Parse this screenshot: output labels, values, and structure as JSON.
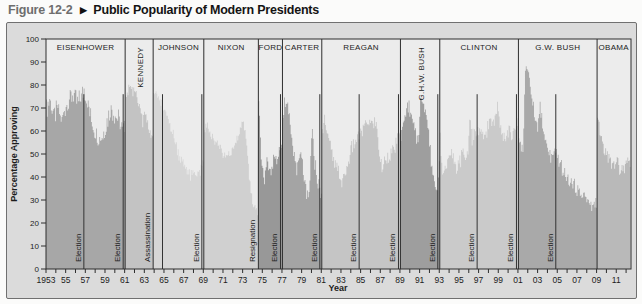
{
  "figure": {
    "number": "Figure 12-2",
    "caret": "▶",
    "title": "Public Popularity of Modern Presidents"
  },
  "chart_data": {
    "type": "area",
    "title": "Public Popularity of Modern Presidents",
    "xlabel": "Year",
    "ylabel": "Percentage Approving",
    "grid": false,
    "legend": "none",
    "plot_bg": "#ececec",
    "frame_color": "#2e2e2e",
    "marker_line_color": "#333333",
    "y_axis": {
      "min": 0,
      "max": 100,
      "tick_step": 10,
      "ticks": [
        0,
        10,
        20,
        30,
        40,
        50,
        60,
        70,
        80,
        90,
        100
      ]
    },
    "x_axis": {
      "min": 1953,
      "max": 2012.5,
      "minor_tick_step": 1,
      "ticks": [
        {
          "year": 1953,
          "label": "1953"
        },
        {
          "year": 1955,
          "label": "55"
        },
        {
          "year": 1957,
          "label": "57"
        },
        {
          "year": 1959,
          "label": "59"
        },
        {
          "year": 1961,
          "label": "61"
        },
        {
          "year": 1963,
          "label": "63"
        },
        {
          "year": 1965,
          "label": "65"
        },
        {
          "year": 1967,
          "label": "67"
        },
        {
          "year": 1969,
          "label": "69"
        },
        {
          "year": 1971,
          "label": "71"
        },
        {
          "year": 1973,
          "label": "73"
        },
        {
          "year": 1975,
          "label": "75"
        },
        {
          "year": 1977,
          "label": "77"
        },
        {
          "year": 1979,
          "label": "79"
        },
        {
          "year": 1981,
          "label": "81"
        },
        {
          "year": 1983,
          "label": "83"
        },
        {
          "year": 1985,
          "label": "85"
        },
        {
          "year": 1987,
          "label": "87"
        },
        {
          "year": 1989,
          "label": "89"
        },
        {
          "year": 1991,
          "label": "91"
        },
        {
          "year": 1993,
          "label": "93"
        },
        {
          "year": 1995,
          "label": "95"
        },
        {
          "year": 1997,
          "label": "97"
        },
        {
          "year": 1999,
          "label": "99"
        },
        {
          "year": 2001,
          "label": "01"
        },
        {
          "year": 2003,
          "label": "03"
        },
        {
          "year": 2005,
          "label": "05"
        },
        {
          "year": 2007,
          "label": "07"
        },
        {
          "year": 2009,
          "label": "09"
        },
        {
          "year": 2011,
          "label": "11"
        }
      ]
    },
    "series": [
      {
        "name": "EISENHOWER",
        "label_vertical": false,
        "color": "#a7a7a7",
        "noise": 5,
        "start": 1953.0,
        "end": 1961.05,
        "points": [
          [
            1953.0,
            69
          ],
          [
            1953.4,
            74
          ],
          [
            1953.8,
            66
          ],
          [
            1954.2,
            70
          ],
          [
            1954.6,
            64
          ],
          [
            1955.0,
            71
          ],
          [
            1955.4,
            74
          ],
          [
            1955.8,
            76
          ],
          [
            1956.2,
            72
          ],
          [
            1956.6,
            75
          ],
          [
            1956.9,
            78
          ],
          [
            1957.2,
            73
          ],
          [
            1957.6,
            65
          ],
          [
            1958.0,
            60
          ],
          [
            1958.4,
            57
          ],
          [
            1958.8,
            58
          ],
          [
            1959.2,
            64
          ],
          [
            1959.6,
            70
          ],
          [
            1960.0,
            67
          ],
          [
            1960.4,
            65
          ],
          [
            1960.8,
            60
          ],
          [
            1961.05,
            62
          ]
        ]
      },
      {
        "name": "KENNEDY",
        "label_vertical": true,
        "color": "#c3c3c3",
        "noise": 3,
        "start": 1961.05,
        "end": 1963.9,
        "points": [
          [
            1961.05,
            73
          ],
          [
            1961.3,
            77
          ],
          [
            1961.6,
            79
          ],
          [
            1961.9,
            78
          ],
          [
            1962.2,
            76
          ],
          [
            1962.5,
            70
          ],
          [
            1962.8,
            64
          ],
          [
            1963.1,
            68
          ],
          [
            1963.4,
            62
          ],
          [
            1963.7,
            58
          ],
          [
            1963.9,
            58
          ]
        ]
      },
      {
        "name": "JOHNSON",
        "label_vertical": false,
        "color": "#d6d6d6",
        "noise": 2.5,
        "start": 1963.9,
        "end": 1969.05,
        "points": [
          [
            1963.9,
            78
          ],
          [
            1964.2,
            76
          ],
          [
            1964.6,
            73
          ],
          [
            1964.9,
            70
          ],
          [
            1965.3,
            66
          ],
          [
            1965.7,
            62
          ],
          [
            1966.1,
            56
          ],
          [
            1966.5,
            50
          ],
          [
            1966.9,
            46
          ],
          [
            1967.3,
            44
          ],
          [
            1967.7,
            40
          ],
          [
            1968.1,
            42
          ],
          [
            1968.5,
            41
          ],
          [
            1968.9,
            44
          ],
          [
            1969.05,
            48
          ]
        ]
      },
      {
        "name": "NIXON",
        "label_vertical": false,
        "color": "#d0d0d0",
        "noise": 2,
        "start": 1969.05,
        "end": 1974.6,
        "points": [
          [
            1969.05,
            60
          ],
          [
            1969.4,
            62
          ],
          [
            1969.8,
            58
          ],
          [
            1970.2,
            56
          ],
          [
            1970.6,
            55
          ],
          [
            1971.0,
            50
          ],
          [
            1971.4,
            49
          ],
          [
            1971.8,
            50
          ],
          [
            1972.2,
            54
          ],
          [
            1972.6,
            59
          ],
          [
            1973.0,
            65
          ],
          [
            1973.3,
            59
          ],
          [
            1973.6,
            44
          ],
          [
            1973.9,
            31
          ],
          [
            1974.2,
            26
          ],
          [
            1974.6,
            24
          ]
        ]
      },
      {
        "name": "FORD",
        "label_vertical": false,
        "color": "#989898",
        "noise": 4,
        "start": 1974.6,
        "end": 1977.05,
        "points": [
          [
            1974.62,
            71
          ],
          [
            1974.75,
            66
          ],
          [
            1974.9,
            50
          ],
          [
            1975.1,
            39
          ],
          [
            1975.3,
            42
          ],
          [
            1975.5,
            47
          ],
          [
            1975.7,
            45
          ],
          [
            1975.9,
            43
          ],
          [
            1976.1,
            46
          ],
          [
            1976.3,
            48
          ],
          [
            1976.5,
            45
          ],
          [
            1976.7,
            50
          ],
          [
            1976.9,
            53
          ],
          [
            1977.05,
            53
          ]
        ]
      },
      {
        "name": "CARTER",
        "label_vertical": false,
        "color": "#a4a4a4",
        "noise": 4,
        "start": 1977.05,
        "end": 1981.05,
        "points": [
          [
            1977.05,
            66
          ],
          [
            1977.2,
            71
          ],
          [
            1977.4,
            74
          ],
          [
            1977.7,
            66
          ],
          [
            1978.0,
            55
          ],
          [
            1978.3,
            48
          ],
          [
            1978.6,
            43
          ],
          [
            1978.9,
            50
          ],
          [
            1979.2,
            42
          ],
          [
            1979.5,
            30
          ],
          [
            1979.8,
            32
          ],
          [
            1979.95,
            54
          ],
          [
            1980.1,
            58
          ],
          [
            1980.3,
            48
          ],
          [
            1980.6,
            39
          ],
          [
            1980.9,
            33
          ],
          [
            1981.05,
            34
          ]
        ]
      },
      {
        "name": "REAGAN",
        "label_vertical": false,
        "color": "#c5c5c5",
        "noise": 3,
        "start": 1981.05,
        "end": 1989.05,
        "points": [
          [
            1981.05,
            57
          ],
          [
            1981.3,
            67
          ],
          [
            1981.6,
            60
          ],
          [
            1981.9,
            54
          ],
          [
            1982.2,
            47
          ],
          [
            1982.5,
            44
          ],
          [
            1982.8,
            42
          ],
          [
            1983.1,
            37
          ],
          [
            1983.4,
            41
          ],
          [
            1983.7,
            45
          ],
          [
            1984.0,
            52
          ],
          [
            1984.3,
            54
          ],
          [
            1984.6,
            56
          ],
          [
            1984.9,
            59
          ],
          [
            1985.2,
            60
          ],
          [
            1985.5,
            63
          ],
          [
            1985.8,
            64
          ],
          [
            1986.1,
            63
          ],
          [
            1986.4,
            64
          ],
          [
            1986.7,
            61
          ],
          [
            1986.95,
            48
          ],
          [
            1987.2,
            43
          ],
          [
            1987.5,
            48
          ],
          [
            1987.8,
            49
          ],
          [
            1988.1,
            50
          ],
          [
            1988.4,
            52
          ],
          [
            1988.7,
            55
          ],
          [
            1989.05,
            62
          ]
        ]
      },
      {
        "name": "G.H.W. BUSH",
        "label_vertical": true,
        "color": "#9e9e9e",
        "noise": 3,
        "start": 1989.05,
        "end": 1993.05,
        "points": [
          [
            1989.05,
            56
          ],
          [
            1989.3,
            62
          ],
          [
            1989.6,
            68
          ],
          [
            1989.9,
            71
          ],
          [
            1990.1,
            67
          ],
          [
            1990.4,
            62
          ],
          [
            1990.7,
            56
          ],
          [
            1990.9,
            58
          ],
          [
            1991.1,
            73
          ],
          [
            1991.3,
            74
          ],
          [
            1991.6,
            70
          ],
          [
            1991.9,
            60
          ],
          [
            1992.2,
            46
          ],
          [
            1992.5,
            38
          ],
          [
            1992.8,
            35
          ],
          [
            1992.95,
            43
          ],
          [
            1993.05,
            50
          ]
        ]
      },
      {
        "name": "CLINTON",
        "label_vertical": false,
        "color": "#cacaca",
        "noise": 3.5,
        "start": 1993.05,
        "end": 2001.05,
        "points": [
          [
            1993.05,
            58
          ],
          [
            1993.3,
            45
          ],
          [
            1993.6,
            42
          ],
          [
            1993.9,
            49
          ],
          [
            1994.2,
            52
          ],
          [
            1994.5,
            45
          ],
          [
            1994.8,
            42
          ],
          [
            1995.1,
            47
          ],
          [
            1995.4,
            50
          ],
          [
            1995.7,
            48
          ],
          [
            1995.95,
            52
          ],
          [
            1996.1,
            68
          ],
          [
            1996.3,
            57
          ],
          [
            1996.6,
            58
          ],
          [
            1996.9,
            60
          ],
          [
            1997.2,
            58
          ],
          [
            1997.5,
            57
          ],
          [
            1997.8,
            60
          ],
          [
            1998.1,
            64
          ],
          [
            1998.4,
            63
          ],
          [
            1998.7,
            65
          ],
          [
            1998.95,
            72
          ],
          [
            1999.2,
            64
          ],
          [
            1999.5,
            59
          ],
          [
            1999.8,
            57
          ],
          [
            2000.1,
            61
          ],
          [
            2000.4,
            58
          ],
          [
            2000.7,
            59
          ],
          [
            2001.05,
            64
          ]
        ]
      },
      {
        "name": "G.W. BUSH",
        "label_vertical": false,
        "color": "#a9a9a9",
        "noise": 3,
        "start": 2001.05,
        "end": 2009.05,
        "points": [
          [
            2001.05,
            58
          ],
          [
            2001.3,
            54
          ],
          [
            2001.55,
            52
          ],
          [
            2001.72,
            86
          ],
          [
            2001.9,
            88
          ],
          [
            2002.1,
            83
          ],
          [
            2002.4,
            76
          ],
          [
            2002.7,
            68
          ],
          [
            2003.0,
            60
          ],
          [
            2003.25,
            72
          ],
          [
            2003.5,
            62
          ],
          [
            2003.8,
            55
          ],
          [
            2004.1,
            51
          ],
          [
            2004.4,
            48
          ],
          [
            2004.7,
            50
          ],
          [
            2005.0,
            49
          ],
          [
            2005.3,
            46
          ],
          [
            2005.6,
            42
          ],
          [
            2005.9,
            40
          ],
          [
            2006.2,
            38
          ],
          [
            2006.5,
            37
          ],
          [
            2006.8,
            36
          ],
          [
            2007.1,
            34
          ],
          [
            2007.4,
            32
          ],
          [
            2007.7,
            33
          ],
          [
            2008.0,
            30
          ],
          [
            2008.3,
            28
          ],
          [
            2008.6,
            27
          ],
          [
            2008.9,
            29
          ],
          [
            2009.05,
            30
          ]
        ]
      },
      {
        "name": "OBAMA",
        "label_vertical": false,
        "color": "#b9b9b9",
        "noise": 3.5,
        "start": 2009.05,
        "end": 2012.45,
        "points": [
          [
            2009.05,
            64
          ],
          [
            2009.3,
            61
          ],
          [
            2009.6,
            55
          ],
          [
            2009.9,
            50
          ],
          [
            2010.2,
            48
          ],
          [
            2010.5,
            46
          ],
          [
            2010.8,
            45
          ],
          [
            2011.1,
            47
          ],
          [
            2011.4,
            43
          ],
          [
            2011.7,
            42
          ],
          [
            2012.0,
            45
          ],
          [
            2012.3,
            47
          ],
          [
            2012.45,
            46
          ]
        ]
      }
    ],
    "markers": {
      "election_line_top_value": 76,
      "elections": [
        {
          "year": 1956.85,
          "label": "Election"
        },
        {
          "year": 1960.85,
          "label": "Election"
        },
        {
          "year": 1964.85,
          "label": ""
        },
        {
          "year": 1968.85,
          "label": "Election"
        },
        {
          "year": 1976.85,
          "label": "Election"
        },
        {
          "year": 1980.85,
          "label": "Election"
        },
        {
          "year": 1984.85,
          "label": "Election"
        },
        {
          "year": 1988.85,
          "label": "Election"
        },
        {
          "year": 1992.85,
          "label": "Election"
        },
        {
          "year": 1996.85,
          "label": "Election"
        },
        {
          "year": 2000.85,
          "label": "Election"
        },
        {
          "year": 2004.85,
          "label": "Election"
        }
      ],
      "events": [
        {
          "year": 1963.9,
          "label": "Assassination"
        },
        {
          "year": 1974.6,
          "label": "Resignation"
        }
      ]
    }
  }
}
